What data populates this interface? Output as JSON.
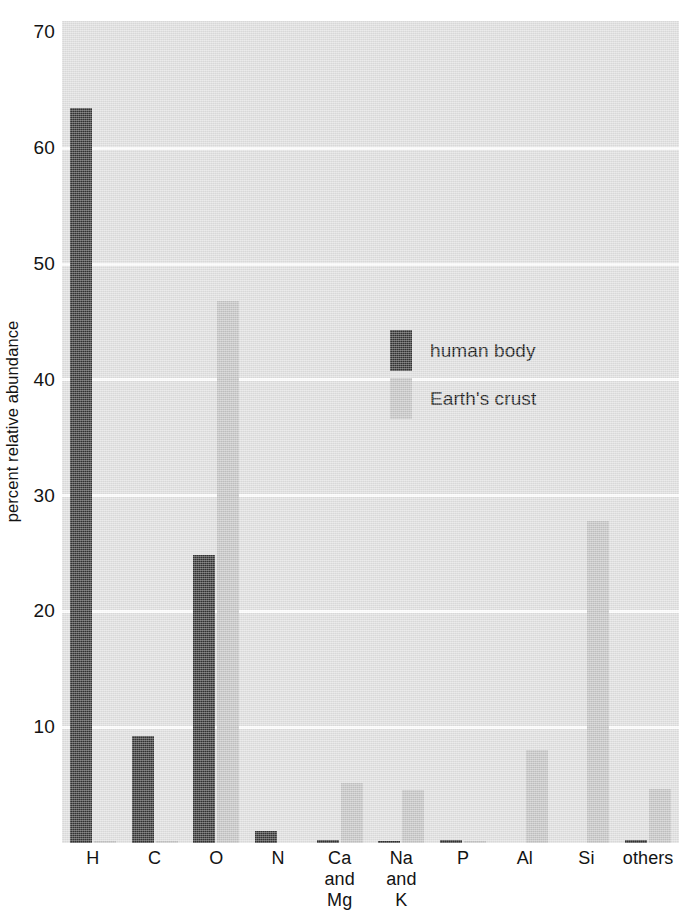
{
  "chart_data": {
    "type": "bar",
    "title": "",
    "subtitle": "",
    "xlabel": "",
    "ylabel": "percent relative abundance",
    "categories": [
      "H",
      "C",
      "O",
      "N",
      "Ca and Mg",
      "Na and K",
      "P",
      "Al",
      "Si",
      "others"
    ],
    "category_lines": [
      [
        "H"
      ],
      [
        "C"
      ],
      [
        "O"
      ],
      [
        "N"
      ],
      [
        "Ca",
        "and",
        "Mg"
      ],
      [
        "Na",
        "and",
        "K"
      ],
      [
        "P"
      ],
      [
        "Al"
      ],
      [
        "Si"
      ],
      [
        "others"
      ]
    ],
    "series": [
      {
        "name": "human body",
        "color": "#333333",
        "values": [
          63.5,
          9.2,
          24.9,
          1.0,
          0.3,
          0.2,
          0.3,
          0.0,
          0.0,
          0.3
        ]
      },
      {
        "name": "Earth's crust",
        "color": "#c3c3c3",
        "values": [
          0.2,
          0.1,
          46.8,
          0.0,
          5.2,
          4.6,
          0.1,
          8.0,
          27.8,
          4.7
        ]
      }
    ],
    "ylim": [
      0,
      70
    ],
    "yticks": [
      10,
      20,
      30,
      40,
      50,
      60,
      70
    ],
    "ytick_labels": [
      "10",
      "20",
      "30",
      "40",
      "50",
      "60",
      "70"
    ],
    "grid": "horizontal",
    "legend_position": "inside-upper-right",
    "plot_background": "#dedede",
    "gridline_color": "#fdfdfd",
    "text_color": "#131313"
  },
  "legend": {
    "entries": [
      {
        "label": "human body",
        "color": "#333333"
      },
      {
        "label": "Earth's crust",
        "color": "#c3c3c3"
      }
    ]
  }
}
